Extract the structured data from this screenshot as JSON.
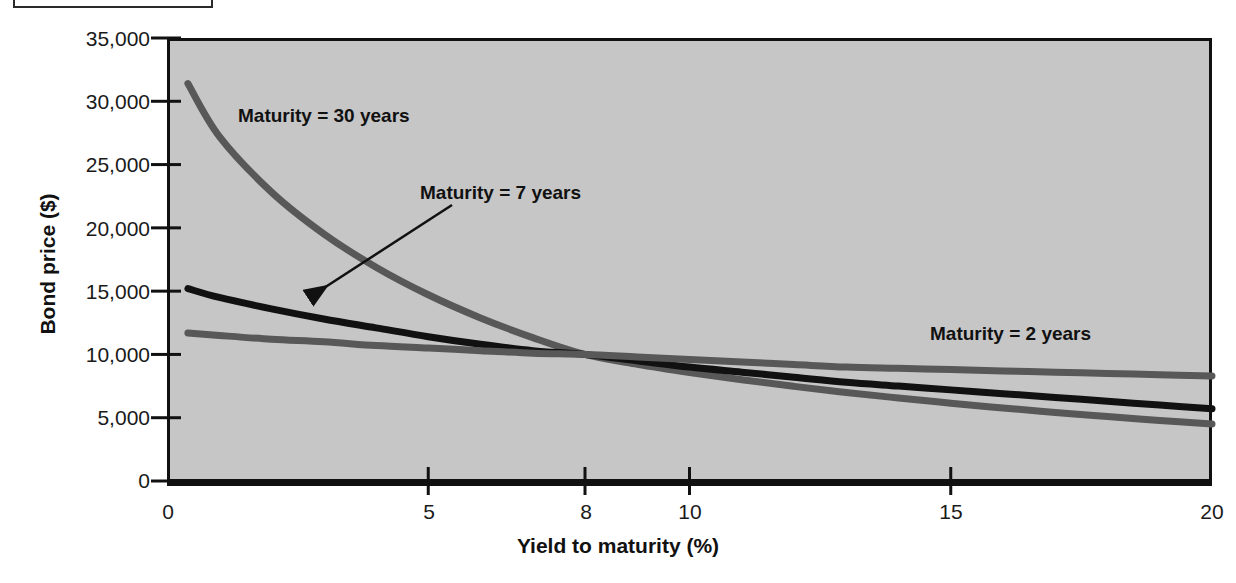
{
  "figure": {
    "caption_box_label": "",
    "background_color": "#ffffff",
    "plot_background_color": "#c6c6c6",
    "frame_color": "#111111"
  },
  "chart_data": {
    "type": "line",
    "title": "",
    "xlabel": "Yield to maturity (%)",
    "ylabel": "Bond price ($)",
    "xlim": [
      0,
      20
    ],
    "ylim": [
      0,
      35000
    ],
    "xticks": [
      0,
      5,
      8,
      10,
      15,
      20
    ],
    "xtick_labels": [
      "0",
      "5",
      "8",
      "10",
      "15",
      "20"
    ],
    "yticks": [
      0,
      5000,
      10000,
      15000,
      20000,
      25000,
      30000,
      35000
    ],
    "ytick_labels": [
      "0",
      "5,000",
      "10,000",
      "15,000",
      "20,000",
      "25,000",
      "30,000",
      "35,000"
    ],
    "grid": false,
    "legend": "inline-annotations",
    "x": [
      0.4,
      1,
      2,
      3,
      4,
      5,
      6,
      7,
      8,
      9,
      10,
      11,
      12,
      13,
      14,
      15,
      16,
      17,
      18,
      19,
      20
    ],
    "series": [
      {
        "name": "Maturity = 30 years",
        "color": "#585858",
        "line_width": 7,
        "values": [
          31400,
          29000,
          25100,
          21900,
          19200,
          17000,
          15100,
          13500,
          10000,
          10900,
          9900,
          9100,
          8400,
          7800,
          7300,
          6800,
          6400,
          6000,
          5600,
          5100,
          4500
        ]
      },
      {
        "name": "Maturity = 7 years",
        "color": "#111111",
        "line_width": 7,
        "values": [
          15200,
          14500,
          13600,
          12800,
          12100,
          11400,
          10800,
          10300,
          10000,
          9500,
          9000,
          8600,
          8200,
          7800,
          7500,
          7200,
          6900,
          6600,
          6300,
          6000,
          5700
        ]
      },
      {
        "name": "Maturity = 2 years",
        "color": "#585858",
        "line_width": 7,
        "values": [
          11700,
          11500,
          11200,
          11000,
          10700,
          10500,
          10300,
          10100,
          10000,
          9800,
          9600,
          9400,
          9200,
          9000,
          8900,
          8800,
          8700,
          8600,
          8500,
          8400,
          8300
        ]
      }
    ],
    "annotations": [
      {
        "text": "Maturity = 30 years",
        "x": 4.3,
        "y": 28400,
        "arrow": false
      },
      {
        "text": "Maturity = 7 years",
        "x": 8.2,
        "y": 21600,
        "arrow": true,
        "arrow_to_x": 2.7,
        "arrow_to_y": 14700
      },
      {
        "text": "Maturity = 2 years",
        "x": 17.1,
        "y": 11900,
        "arrow": false
      }
    ],
    "crossing_point": {
      "x": 8,
      "y": 10000
    }
  }
}
